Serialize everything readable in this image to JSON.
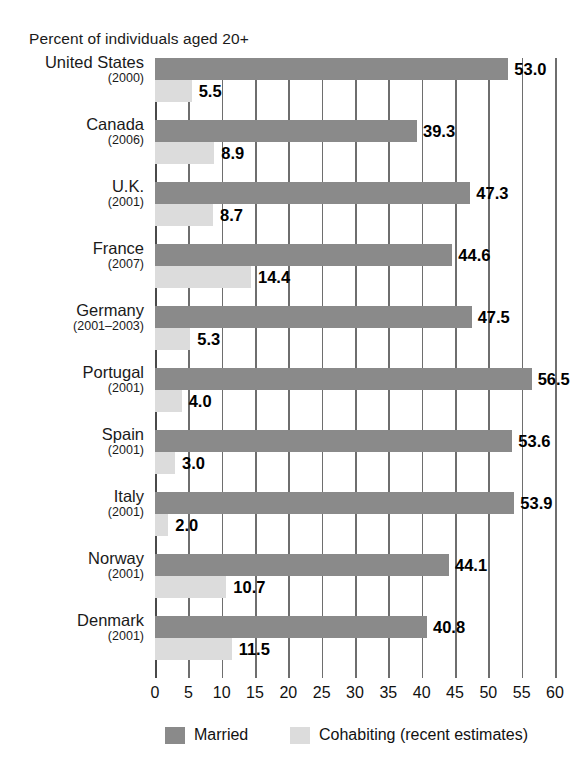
{
  "chart_data": {
    "type": "bar",
    "title": "Percent of individuals aged 20+",
    "xlabel": "",
    "ylabel": "",
    "xlim": [
      0,
      60
    ],
    "xticks": [
      0,
      5,
      10,
      15,
      20,
      25,
      30,
      35,
      40,
      45,
      50,
      55,
      60
    ],
    "grid": true,
    "orientation": "horizontal",
    "legend_position": "bottom",
    "categories": [
      "United States",
      "Canada",
      "U.K.",
      "France",
      "Germany",
      "Portugal",
      "Spain",
      "Italy",
      "Norway",
      "Denmark"
    ],
    "category_years": [
      "(2000)",
      "(2006)",
      "(2001)",
      "(2007)",
      "(2001–2003)",
      "(2001)",
      "(2001)",
      "(2001)",
      "(2001)",
      "(2001)"
    ],
    "series": [
      {
        "name": "Married",
        "color": "#8a8a8a",
        "values": [
          53.0,
          39.3,
          47.3,
          44.6,
          47.5,
          56.5,
          53.6,
          53.9,
          44.1,
          40.8
        ],
        "labels": [
          "53.0",
          "39.3",
          "47.3",
          "44.6",
          "47.5",
          "56.5",
          "53.6",
          "53.9",
          "44.1",
          "40.8"
        ]
      },
      {
        "name": "Cohabiting (recent estimates)",
        "color": "#dcdcdc",
        "values": [
          5.5,
          8.9,
          8.7,
          14.4,
          5.3,
          4.0,
          3.0,
          2.0,
          10.7,
          11.5
        ],
        "labels": [
          "5.5",
          "8.9",
          "8.7",
          "14.4",
          "5.3",
          "4.0",
          "3.0",
          "2.0",
          "10.7",
          "11.5"
        ]
      }
    ]
  },
  "legend": {
    "items": [
      {
        "label": "Married",
        "swatch": "married"
      },
      {
        "label": "Cohabiting (recent estimates)",
        "swatch": "cohab"
      }
    ]
  },
  "colors": {
    "married": "#8a8a8a",
    "cohabiting": "#dcdcdc",
    "gridline": "#6e6e6e",
    "text": "#111111",
    "background": "#ffffff"
  }
}
